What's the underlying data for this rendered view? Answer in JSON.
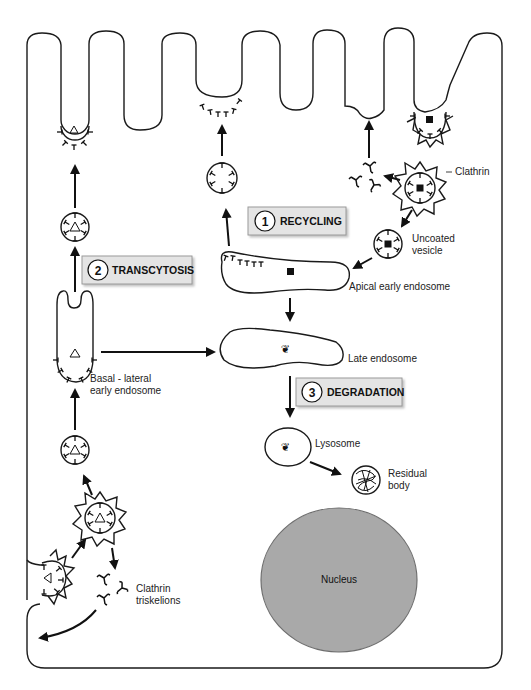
{
  "diagram": {
    "type": "cell-endocytosis-pathways",
    "pathways": [
      {
        "number": "1",
        "label": "RECYCLING"
      },
      {
        "number": "2",
        "label": "TRANSCYTOSIS"
      },
      {
        "number": "3",
        "label": "DEGRADATION"
      }
    ],
    "labels": {
      "clathrin": "Clathrin",
      "uncoated_vesicle_1": "Uncoated",
      "uncoated_vesicle_2": "vesicle",
      "apical_early_endosome": "Apical early endosome",
      "late_endosome": "Late endosome",
      "basal_lateral_1": "Basal - lateral",
      "basal_lateral_2": "early endosome",
      "lysosome": "Lysosome",
      "residual_body_1": "Residual",
      "residual_body_2": "body",
      "nucleus": "Nucleus",
      "clathrin_triskelions_1": "Clathrin",
      "clathrin_triskelions_2": "triskelions"
    },
    "colors": {
      "stroke": "#1a1a1a",
      "label_box_fill": "#e4e4e4",
      "label_box_border": "#9a9a9a",
      "nucleus_fill": "#a9a9a9",
      "nucleus_border": "#6e6e6e",
      "background": "#ffffff"
    }
  }
}
